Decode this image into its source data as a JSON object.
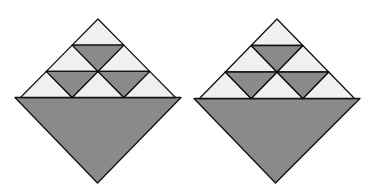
{
  "diagram": {
    "title": "",
    "figures": [
      {
        "id": "left",
        "description": "Diamond made of a triangular pyramid of 9 small triangles above a large inverted dark triangle",
        "small_triangles_up": 6,
        "small_triangles_down_dark": 3,
        "rows": 3,
        "colors": {
          "light": "#f0f0f0",
          "dark": "#8a8a8a",
          "outline": "#111111"
        }
      },
      {
        "id": "right",
        "description": "Identical diamond figure",
        "small_triangles_up": 6,
        "small_triangles_down_dark": 3,
        "rows": 3,
        "colors": {
          "light": "#f0f0f0",
          "dark": "#8a8a8a",
          "outline": "#111111"
        }
      }
    ]
  }
}
